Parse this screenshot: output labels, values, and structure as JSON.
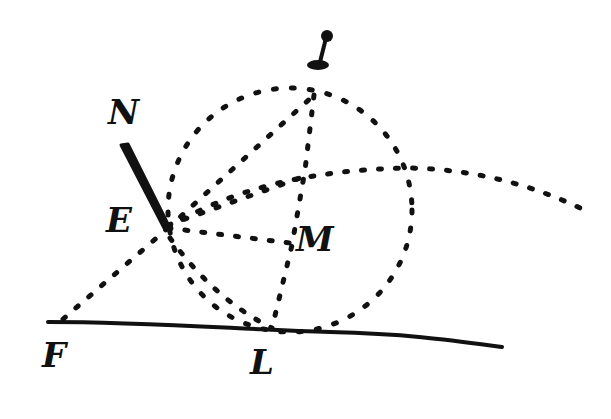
{
  "figure": {
    "kind": "hand-drawn geometric optics diagram",
    "colors": {
      "ink": "#111111",
      "background": "#ffffff"
    },
    "labels": [
      {
        "id": "I",
        "text": "I",
        "x": 308,
        "y": 30
      },
      {
        "id": "N",
        "text": "N",
        "x": 110,
        "y": 95
      },
      {
        "id": "E",
        "text": "E",
        "x": 108,
        "y": 205
      },
      {
        "id": "M",
        "text": "M",
        "x": 298,
        "y": 223
      },
      {
        "id": "F",
        "text": "F",
        "x": 42,
        "y": 338
      },
      {
        "id": "L",
        "text": "L",
        "x": 250,
        "y": 345
      }
    ],
    "points": {
      "I": [
        318,
        62
      ],
      "top": [
        314,
        95
      ],
      "E": [
        168,
        228
      ],
      "M": [
        290,
        243
      ],
      "L": [
        272,
        328
      ],
      "F": [
        60,
        322
      ],
      "R": [
        410,
        168
      ],
      "N_start": [
        122,
        145
      ]
    },
    "circle": {
      "cx": 290,
      "cy": 210,
      "r": 122,
      "style": "dotted"
    },
    "solid_line": {
      "from": [
        48,
        322
      ],
      "to": [
        502,
        347
      ]
    },
    "stroke_NE": {
      "from": [
        122,
        145
      ],
      "to": [
        168,
        228
      ],
      "width": 8
    },
    "dotted_lines": [
      {
        "name": "E-F",
        "from": [
          168,
          228
        ],
        "to": [
          60,
          322
        ]
      },
      {
        "name": "E-M",
        "from": [
          168,
          228
        ],
        "to": [
          290,
          243
        ]
      },
      {
        "name": "E-top",
        "from": [
          168,
          228
        ],
        "to": [
          314,
          95
        ]
      },
      {
        "name": "top-L",
        "from": [
          314,
          95
        ],
        "to": [
          272,
          328
        ]
      },
      {
        "name": "E-L-arc",
        "from": [
          168,
          228
        ],
        "to": [
          272,
          328
        ]
      },
      {
        "name": "E-R-curve",
        "from": [
          168,
          228
        ],
        "to": [
          580,
          208
        ]
      }
    ]
  }
}
